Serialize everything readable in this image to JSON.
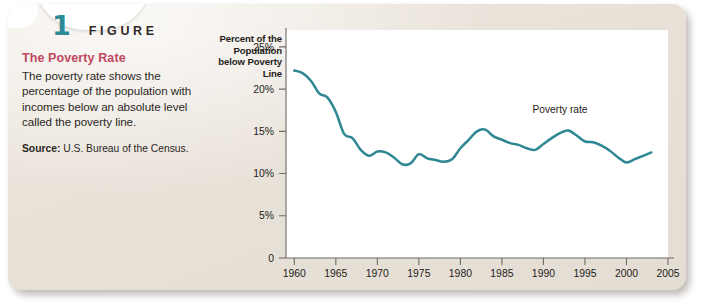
{
  "figure": {
    "number": "1",
    "word": "FIGURE",
    "title": "The Poverty Rate",
    "caption": "The poverty rate shows the percentage of the population with incomes below an absolute level called the poverty line.",
    "source_label": "Source:",
    "source_text": "U.S. Bureau of the Census."
  },
  "colors": {
    "accent_teal": "#2e8a96",
    "line_teal": "#2f8793",
    "title_rose": "#c0485f",
    "card_paper": "#eae4dc",
    "axis_gray": "#6f6a64",
    "text_dark": "#1f1c1a"
  },
  "chart_data": {
    "type": "line",
    "title": "The Poverty Rate",
    "xlabel": "",
    "ylabel": "Percent of the Population below Poverty Line",
    "ylabel_lines": [
      "Percent of the",
      "Population",
      "below Poverty",
      "Line"
    ],
    "xlim": [
      1959,
      2005
    ],
    "ylim": [
      0,
      27
    ],
    "xticks": [
      1960,
      1965,
      1970,
      1975,
      1980,
      1985,
      1990,
      1995,
      2000,
      2005
    ],
    "xtick_labels": [
      "1960",
      "1965",
      "1970",
      "1975",
      "1980",
      "1985",
      "1990",
      "1995",
      "2000",
      "2005"
    ],
    "yticks": [
      0,
      5,
      10,
      15,
      20,
      25
    ],
    "ytick_labels": [
      "0",
      "5%",
      "10%",
      "15%",
      "20%",
      "25%"
    ],
    "grid": false,
    "legend_position": "inline-annotation",
    "annotations": [
      {
        "text": "Poverty rate",
        "x": 1992,
        "y": 17.2
      }
    ],
    "series": [
      {
        "name": "Poverty rate",
        "color": "#2f8793",
        "x": [
          1960,
          1961,
          1962,
          1963,
          1964,
          1965,
          1966,
          1967,
          1968,
          1969,
          1970,
          1971,
          1972,
          1973,
          1974,
          1975,
          1976,
          1977,
          1978,
          1979,
          1980,
          1981,
          1982,
          1983,
          1984,
          1985,
          1986,
          1987,
          1988,
          1989,
          1990,
          1991,
          1992,
          1993,
          1994,
          1995,
          1996,
          1997,
          1998,
          1999,
          2000,
          2001,
          2002,
          2003
        ],
        "values": [
          22.2,
          21.9,
          21.0,
          19.5,
          19.0,
          17.3,
          14.7,
          14.2,
          12.8,
          12.1,
          12.6,
          12.5,
          11.9,
          11.1,
          11.2,
          12.3,
          11.8,
          11.6,
          11.4,
          11.7,
          13.0,
          14.0,
          15.0,
          15.2,
          14.4,
          14.0,
          13.6,
          13.4,
          13.0,
          12.8,
          13.5,
          14.2,
          14.8,
          15.1,
          14.5,
          13.8,
          13.7,
          13.3,
          12.7,
          11.9,
          11.3,
          11.7,
          12.1,
          12.5
        ]
      }
    ]
  }
}
